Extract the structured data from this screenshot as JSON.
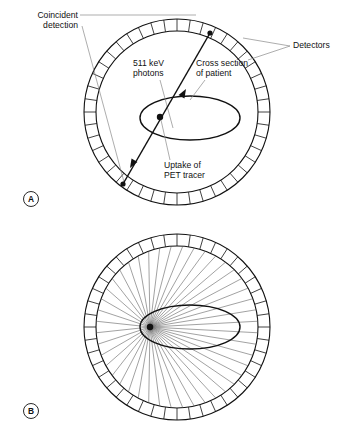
{
  "figure": {
    "background_color": "#ffffff",
    "ink_color": "#111111",
    "leader_color": "#8a8a8a"
  },
  "panels": [
    {
      "id": "A",
      "letter": "A",
      "labels": {
        "coincident_detection_line1": "Coincident",
        "coincident_detection_line2": "detection",
        "detectors": "Detectors",
        "photons_line1": "511 keV",
        "photons_line2": "photons",
        "cross_section_line1": "Cross section",
        "cross_section_line2": "of patient",
        "uptake_line1": "Uptake of",
        "uptake_line2": "PET tracer"
      },
      "geometry": {
        "center_x": 177,
        "center_y": 112,
        "outer_radius": 93,
        "inner_radius": 81,
        "detector_count": 44,
        "ellipse_cx": 190,
        "ellipse_cy": 118,
        "ellipse_rx": 50,
        "ellipse_ry": 22,
        "tracer_x": 160,
        "tracer_y": 117,
        "hit_upper_x": 210,
        "hit_upper_y": 33,
        "hit_lower_x": 123,
        "hit_lower_y": 184
      }
    },
    {
      "id": "B",
      "letter": "B",
      "geometry": {
        "center_x": 177,
        "center_y": 327,
        "outer_radius": 93,
        "inner_radius": 81,
        "detector_count": 44,
        "ellipse_cx": 190,
        "ellipse_cy": 327,
        "ellipse_rx": 50,
        "ellipse_ry": 22,
        "focus_x": 150,
        "focus_y": 327,
        "ray_count": 44
      }
    }
  ]
}
